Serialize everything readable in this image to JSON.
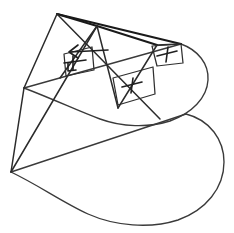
{
  "figure": {
    "title": "Geometric line drawing of a pyramid-cone intersecting a D-shaped cylindrical surface",
    "caption": "",
    "canvas": {
      "width": 234,
      "height": 233
    },
    "colors": {
      "background": "#ffffff",
      "line_main": "#2b2b2b",
      "line_thin": "#2f2f2f",
      "line_curve": "#3a3a3a",
      "mark": "#1f1f1f",
      "heavy": "#1a1a1a"
    },
    "vertices": [
      {
        "name": "apex-top-left",
        "x": 57,
        "y": 14
      },
      {
        "name": "ridge-mid",
        "x": 97,
        "y": 26
      },
      {
        "name": "ridge-right",
        "x": 157,
        "y": 45
      },
      {
        "name": "corner-right-upper",
        "x": 181,
        "y": 44
      },
      {
        "name": "left-mid",
        "x": 24,
        "y": 88
      },
      {
        "name": "crossing-center",
        "x": 110,
        "y": 88
      },
      {
        "name": "bottom-left-apex",
        "x": 11,
        "y": 172
      }
    ],
    "annotations": [
      {
        "name": "perpendicular-mark-left",
        "symbol": "right-angle",
        "x": 72,
        "y": 62
      },
      {
        "name": "plus-mark-center",
        "symbol": "plus",
        "x": 132,
        "y": 85
      },
      {
        "name": "plus-mark-right",
        "symbol": "plus",
        "x": 167,
        "y": 54
      },
      {
        "name": "leader-arrow",
        "symbol": "arrow",
        "x": 88,
        "y": 52
      }
    ],
    "shapes": [
      {
        "name": "upper-d-surface",
        "kind": "stadium-curve"
      },
      {
        "name": "lower-d-surface",
        "kind": "stadium-curve"
      },
      {
        "name": "pyramid-edges",
        "kind": "polyline-set"
      },
      {
        "name": "section-parallelogram",
        "kind": "quad"
      }
    ]
  }
}
